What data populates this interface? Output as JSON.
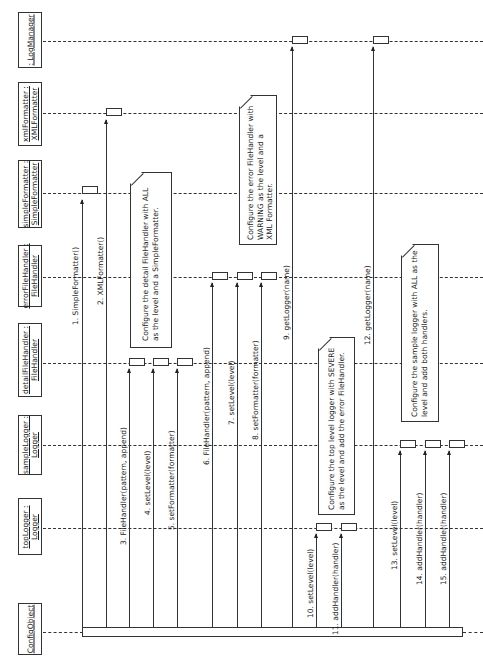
{
  "diagram": {
    "type": "UML sequence diagram",
    "orientation": "rotated 90 degrees counter-clockwise"
  },
  "lifelines": [
    {
      "id": "logManager",
      "label": ": LogManager"
    },
    {
      "id": "xmlFormatter",
      "label": "xmlFormatter :\nXMLFormatter"
    },
    {
      "id": "simpleFormatter",
      "label": "simpleFormatter :\nSimpleFormatter"
    },
    {
      "id": "errorFileHandler",
      "label": "errorFileHandler :\nFileHandler"
    },
    {
      "id": "detailFileHandler",
      "label": "detailFileHandler :\nFileHandler"
    },
    {
      "id": "sampleLogger",
      "label": "sampleLogger :\nLogger"
    },
    {
      "id": "topLogger",
      "label": "topLogger :\nLogger"
    },
    {
      "id": "configObject",
      "label": "ConfigObject"
    }
  ],
  "messages": [
    {
      "num": 1,
      "label": "1. SimpleFormatter()",
      "from": "configObject",
      "to": "simpleFormatter"
    },
    {
      "num": 2,
      "label": "2. XMLFormatter()",
      "from": "configObject",
      "to": "xmlFormatter"
    },
    {
      "num": 3,
      "label": "3. FileHandler(pattern, append)",
      "from": "configObject",
      "to": "detailFileHandler"
    },
    {
      "num": 4,
      "label": "4. setLevel(level)",
      "from": "configObject",
      "to": "detailFileHandler"
    },
    {
      "num": 5,
      "label": "5. setFormatter(formatter)",
      "from": "configObject",
      "to": "detailFileHandler"
    },
    {
      "num": 6,
      "label": "6. FileHandler(pattern, append)",
      "from": "configObject",
      "to": "errorFileHandler"
    },
    {
      "num": 7,
      "label": "7. setLevel(level)",
      "from": "configObject",
      "to": "errorFileHandler"
    },
    {
      "num": 8,
      "label": "8. setFormatter(formatter)",
      "from": "configObject",
      "to": "errorFileHandler"
    },
    {
      "num": 9,
      "label": "9. getLogger(name)",
      "from": "configObject",
      "to": "logManager"
    },
    {
      "num": 10,
      "label": "10. setLevel(level)",
      "from": "configObject",
      "to": "topLogger"
    },
    {
      "num": 11,
      "label": "11. addHandler(handler)",
      "from": "configObject",
      "to": "topLogger"
    },
    {
      "num": 12,
      "label": "12. getLogger(name)",
      "from": "configObject",
      "to": "logManager"
    },
    {
      "num": 13,
      "label": "13. setLevel(level)",
      "from": "configObject",
      "to": "sampleLogger"
    },
    {
      "num": 14,
      "label": "14. addHandler(handler)",
      "from": "configObject",
      "to": "sampleLogger"
    },
    {
      "num": 15,
      "label": "15. addHandler(handler)",
      "from": "configObject",
      "to": "sampleLogger"
    }
  ],
  "notes": [
    {
      "id": "note-detail",
      "text": "Configure the detail FileHandler with ALL\nas the level and a SimpleFormatter."
    },
    {
      "id": "note-error",
      "text": "Configure the error FileHandler with\nWARNING as the level and a\nXML Formatter."
    },
    {
      "id": "note-top",
      "text": "Configure the top level logger with SEVERE\nas the level and add the error FileHandler."
    },
    {
      "id": "note-sample",
      "text": "Configure the sample logger with ALL as the\nlevel and add both handlers."
    }
  ]
}
